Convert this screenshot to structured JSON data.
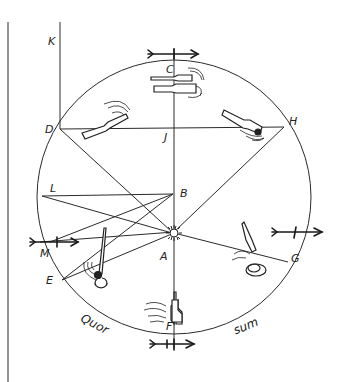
{
  "diagram": {
    "type": "circle geometry with point labels and figure sketches",
    "stroke_color": "#2a2a2a",
    "points": [
      {
        "id": "K",
        "label": "K"
      },
      {
        "id": "C",
        "label": "C"
      },
      {
        "id": "D",
        "label": "D"
      },
      {
        "id": "J",
        "label": "J"
      },
      {
        "id": "H",
        "label": "H"
      },
      {
        "id": "L",
        "label": "L"
      },
      {
        "id": "B",
        "label": "B"
      },
      {
        "id": "M",
        "label": "M"
      },
      {
        "id": "A",
        "label": "A"
      },
      {
        "id": "E",
        "label": "E"
      },
      {
        "id": "G",
        "label": "G"
      },
      {
        "id": "F",
        "label": "F"
      }
    ],
    "words": {
      "left_arc": "Quor",
      "right_arc": "sum"
    }
  }
}
